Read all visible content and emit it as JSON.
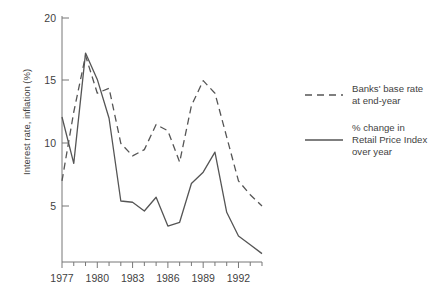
{
  "chart_data": {
    "type": "line",
    "title": "",
    "xlabel": "",
    "ylabel": "Interest rate, inflation (%)",
    "xlim": [
      1977,
      1994
    ],
    "ylim": [
      0,
      20
    ],
    "y_ticks": [
      5,
      10,
      15,
      20
    ],
    "y_tick_labels": [
      "5",
      "10",
      "15",
      "20"
    ],
    "x_ticks": [
      1977,
      1978,
      1979,
      1980,
      1981,
      1982,
      1983,
      1984,
      1985,
      1986,
      1987,
      1988,
      1989,
      1990,
      1991,
      1992,
      1993,
      1994
    ],
    "x_tick_labels": [
      "1977",
      "",
      "",
      "1980",
      "",
      "",
      "1983",
      "",
      "",
      "1986",
      "",
      "",
      "1989",
      "",
      "",
      "1992",
      "",
      ""
    ],
    "grid": false,
    "legend_position": "right",
    "x": [
      1977,
      1978,
      1979,
      1980,
      1981,
      1982,
      1983,
      1984,
      1985,
      1986,
      1987,
      1988,
      1989,
      1990,
      1991,
      1992,
      1993,
      1994
    ],
    "series": [
      {
        "name": "Banks' base rate at end-year",
        "style": "dashed",
        "color": "#555555",
        "values": [
          7.0,
          12.5,
          17.0,
          14.0,
          14.4,
          10.0,
          9.0,
          9.5,
          11.5,
          11.0,
          8.5,
          13.0,
          15.0,
          14.0,
          10.5,
          7.0,
          5.9,
          5.0
        ]
      },
      {
        "name": "% change in Retail Price Index over year",
        "style": "solid",
        "color": "#555555",
        "values": [
          12.1,
          8.4,
          17.2,
          15.1,
          12.0,
          5.4,
          5.3,
          4.6,
          5.7,
          3.4,
          3.7,
          6.8,
          7.7,
          9.3,
          4.5,
          2.6,
          1.9,
          1.2
        ]
      }
    ],
    "legend": [
      {
        "line_style": "dashed",
        "label_lines": [
          "Banks' base rate",
          "at end-year"
        ]
      },
      {
        "line_style": "solid",
        "label_lines": [
          "% change in",
          "Retail Price Index",
          "over year"
        ]
      }
    ]
  },
  "colors": {
    "axis": "#777777",
    "text": "#3f3f3f",
    "line": "#555555",
    "background": "#ffffff"
  }
}
